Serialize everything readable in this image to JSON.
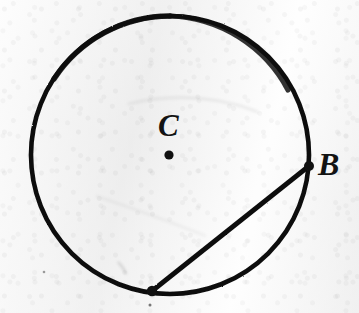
{
  "figure": {
    "kind": "circle-geometry-diagram",
    "background_color": "#f1f1f1",
    "ink_color": "#111111",
    "labels": {
      "center_label": "C",
      "point_b_label": "B"
    },
    "points": [
      {
        "name": "center-point",
        "label": "C",
        "x": 169,
        "y": 155,
        "marker": "filled-dot",
        "marker_radius": 4.6
      },
      {
        "name": "point-b",
        "label": "B",
        "x": 309,
        "y": 166,
        "marker": "filled-dot",
        "marker_radius": 5.0
      },
      {
        "name": "chord-lower-endpoint",
        "label": "",
        "x": 152,
        "y": 291,
        "marker": "filled-dot",
        "marker_radius": 5.2
      }
    ],
    "circle": {
      "center_x": 170,
      "center_y": 155,
      "radius": 139,
      "stroke_width": 4.6,
      "stroke_color": "#111111",
      "fill": "none"
    },
    "chord": {
      "name": "chord-b-to-lower-point",
      "x1": 309,
      "y1": 166,
      "x2": 152,
      "y2": 291,
      "stroke_width": 4.6,
      "stroke_color": "#111111"
    },
    "label_positions": {
      "c": {
        "x": 158,
        "y": 110,
        "font_size": 31
      },
      "b": {
        "x": 318,
        "y": 148,
        "font_size": 32
      }
    }
  }
}
